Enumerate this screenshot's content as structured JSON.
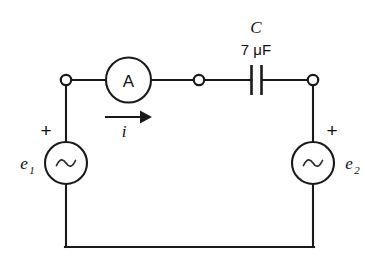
{
  "figure": {
    "type": "circuit-diagram",
    "background_color": "#ffffff",
    "line_color": "#1a1a1a"
  },
  "components": {
    "ammeter": {
      "label": "A",
      "name": "ammeter"
    },
    "capacitor": {
      "designator": "C",
      "value": "7 μF",
      "name": "capacitor"
    },
    "source_left": {
      "label": "e",
      "subscript": "1",
      "polarity": "+",
      "symbol": "sine-wave",
      "name": "ac-voltage-source-left"
    },
    "source_right": {
      "label": "e",
      "subscript": "2",
      "polarity": "+",
      "symbol": "sine-wave",
      "name": "ac-voltage-source-right"
    },
    "current": {
      "label": "i",
      "direction": "right"
    }
  },
  "nodes": {
    "left_terminal": "open-circle",
    "mid_terminal": "open-circle",
    "right_terminal": "open-circle"
  }
}
